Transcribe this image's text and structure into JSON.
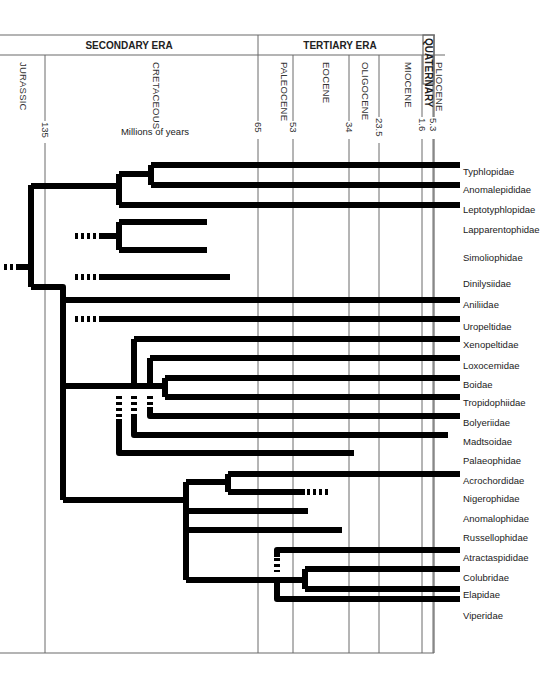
{
  "header": {
    "eras": [
      {
        "id": "secondary",
        "label": "SECONDARY ERA"
      },
      {
        "id": "tertiary",
        "label": "TERTIARY ERA"
      },
      {
        "id": "quaternary",
        "label": "QUATERNARY"
      }
    ],
    "periods": [
      {
        "id": "jurassic",
        "label": "JURASSIC"
      },
      {
        "id": "cretaceous",
        "label": "CRETACEOUS"
      },
      {
        "id": "paleocene",
        "label": "PALEOCENE"
      },
      {
        "id": "eocene",
        "label": "EOCENE"
      },
      {
        "id": "oligocene",
        "label": "OLIGOCENE"
      },
      {
        "id": "miocene",
        "label": "MIOCENE"
      },
      {
        "id": "pliocene",
        "label": "PLIOCENE"
      }
    ],
    "boundaries_mya": [
      "135",
      "65",
      "53",
      "34",
      "23.5",
      "5.3",
      "1.6"
    ],
    "axis_label": "Millions of years"
  },
  "taxa": [
    "Typhlopidae",
    "Anomalepididae",
    "Leptotyphlopidae",
    "Lapparentophidae",
    "Simoliophidae",
    "Dinilysiidae",
    "Aniliidae",
    "Uropeltidae",
    "Xenopeltidae",
    "Loxocemidae",
    "Boidae",
    "Tropidophiidae",
    "Bolyeriidae",
    "Madtsoidae",
    "Palaeophidae",
    "Acrochordidae",
    "Nigerophidae",
    "Anomalophidae",
    "Russellophidae",
    "Atractaspididae",
    "Colubridae",
    "Elapidae",
    "Viperidae"
  ],
  "extinct_taxa": [
    "Lapparentophidae",
    "Simoliophidae",
    "Dinilysiidae",
    "Madtsoidae",
    "Palaeophidae",
    "Nigerophidae",
    "Anomalophidae",
    "Russellophidae"
  ]
}
